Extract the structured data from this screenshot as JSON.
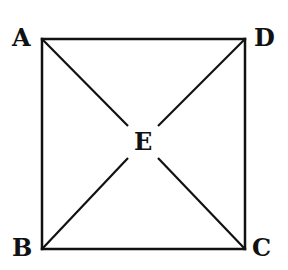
{
  "diagram": {
    "type": "square-with-diagonals",
    "stroke_color": "#111111",
    "points": {
      "A": {
        "label": "A",
        "x": 42,
        "y": 39
      },
      "D": {
        "label": "D",
        "x": 245,
        "y": 39
      },
      "B": {
        "label": "B",
        "x": 42,
        "y": 249
      },
      "C": {
        "label": "C",
        "x": 245,
        "y": 249
      },
      "E": {
        "label": "E",
        "x": 143,
        "y": 144
      }
    },
    "segments": [
      "AD",
      "DC",
      "CB",
      "BA",
      "AC",
      "BD"
    ]
  }
}
